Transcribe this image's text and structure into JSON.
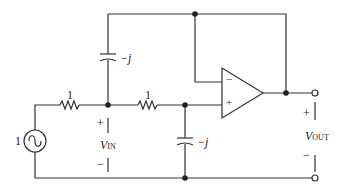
{
  "diagram": {
    "type": "circuit",
    "colors": {
      "wire": "#333333",
      "text": "#222222",
      "background": "#ffffff"
    },
    "source": {
      "label": "1",
      "kind": "ac-voltage-source"
    },
    "resistors": [
      {
        "id": "R1",
        "label": "1"
      },
      {
        "id": "R2",
        "label": "1"
      }
    ],
    "capacitors": [
      {
        "id": "C1",
        "label": "−j",
        "position": "feedback-top"
      },
      {
        "id": "C2",
        "label": "−j",
        "position": "shunt-to-ground"
      }
    ],
    "opamp": {
      "minus_label": "−",
      "plus_label": "+"
    },
    "vin": {
      "plus": "+",
      "minus": "−",
      "symbol": "V",
      "subscript": "IN"
    },
    "vout": {
      "plus": "+",
      "minus": "−",
      "symbol": "V",
      "subscript": "OUT"
    }
  }
}
